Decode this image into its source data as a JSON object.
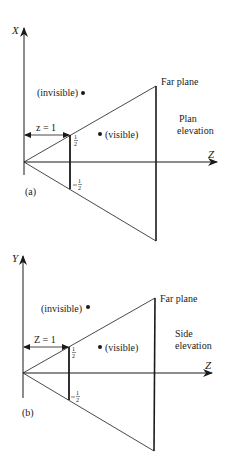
{
  "diagram": {
    "panel_a": {
      "tag": "(a)",
      "vertical_axis": "X",
      "horizontal_axis": "Z",
      "near_label": "z = 1",
      "near_top": "1/2",
      "near_bottom": "−1/2",
      "far_label": "Far plane",
      "view_label_1": "Plan",
      "view_label_2": "elevation",
      "point_invisible": "(invisible)",
      "point_visible": "(visible)"
    },
    "panel_b": {
      "tag": "(b)",
      "vertical_axis": "Y",
      "horizontal_axis": "Z",
      "near_label": "Z = 1",
      "near_top": "1/2",
      "near_bottom": "−1/2",
      "far_label": "Far plane",
      "view_label_1": "Side",
      "view_label_2": "elevation",
      "point_invisible": "(invisible)",
      "point_visible": "(visible)"
    },
    "colors": {
      "ink": "#1a1a1a",
      "background": "#ffffff"
    }
  }
}
